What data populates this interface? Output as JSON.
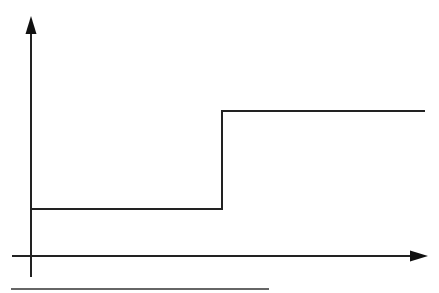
{
  "diagram": {
    "type": "step-function",
    "levels": [
      "low",
      "high"
    ],
    "step_point": "single rising step",
    "line_color": "#222222",
    "background": "#ffffff",
    "elements": [
      {
        "name": "y-axis",
        "arrow": true
      },
      {
        "name": "x-axis",
        "arrow": true
      },
      {
        "name": "step-signal"
      },
      {
        "name": "baseline-underline"
      }
    ]
  }
}
